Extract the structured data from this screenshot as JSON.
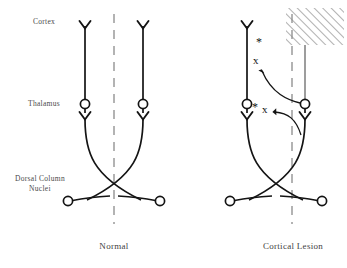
{
  "figure": {
    "title_implicit": "Somatosensory pathway: normal vs cortical lesion",
    "row_labels": [
      {
        "id": "cortex",
        "text": "Cortex",
        "x": 44,
        "y": 22
      },
      {
        "id": "thalamus",
        "text": "Thalamus",
        "x": 44,
        "y": 97
      },
      {
        "id": "dorsal-column-nuclei",
        "text": "Dorsal Column\nNuclei",
        "x": 40,
        "y": 176
      }
    ],
    "panels": [
      {
        "id": "normal",
        "caption": "Normal",
        "caption_x": 114,
        "caption_y": 245
      },
      {
        "id": "cortical-lesion",
        "caption": "Cortical Lesion",
        "caption_x": 292,
        "caption_y": 245
      }
    ],
    "annotations": {
      "x_marks": [
        {
          "id": "x-upper",
          "text": "x",
          "x": 258,
          "y": 62
        },
        {
          "id": "x-lower",
          "text": "x",
          "x": 266,
          "y": 111
        }
      ],
      "asterisks": [
        {
          "id": "asterisk-upper",
          "text": "*",
          "x": 260,
          "y": 43
        },
        {
          "id": "asterisk-lower",
          "text": "*",
          "x": 256,
          "y": 108
        }
      ]
    },
    "colors": {
      "fiber": "#141414",
      "degenerated_fiber": "#8c8c8c",
      "midline": "#9a9a9a",
      "lesion_hatch": "#8e8e8e",
      "text": "#3f3f3f"
    },
    "lesion": {
      "id": "cortical-lesion-box",
      "x": 286,
      "y": 8,
      "width": 58,
      "height": 37
    }
  }
}
